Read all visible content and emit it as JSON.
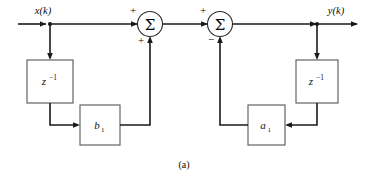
{
  "figure": {
    "caption": "(a)",
    "input_label": "x(k)",
    "output_label": "y(k)"
  },
  "blocks": [
    {
      "id": "delay_left",
      "base": "z",
      "exponent": "−1",
      "name": "z-inverse-left"
    },
    {
      "id": "gain_b1",
      "base": "b",
      "subscript": "1",
      "name": "gain-b1"
    },
    {
      "id": "gain_a1",
      "base": "a",
      "subscript": "1",
      "name": "gain-a1"
    },
    {
      "id": "delay_right",
      "base": "z",
      "exponent": "−1",
      "name": "z-inverse-right"
    }
  ],
  "summers": [
    {
      "id": "summer_1",
      "glyph": "Σ",
      "sign_top": "+",
      "sign_bottom": "+"
    },
    {
      "id": "summer_2",
      "glyph": "Σ",
      "sign_top": "+",
      "sign_bottom": "−"
    }
  ],
  "colors": {
    "wire": "#1a1a1a",
    "box_stroke": "#555555",
    "circle_stroke": "#2a2a2a",
    "background": "#ffffff",
    "text": "#0a0a0a"
  }
}
